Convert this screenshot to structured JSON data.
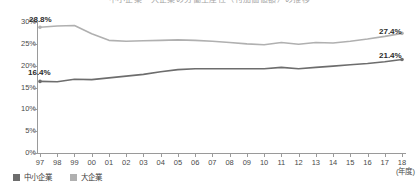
{
  "chart_data": {
    "type": "line",
    "title": "中小企業・大企業の労働生産性（付加価値額）の推移",
    "xlabel": "(年度)",
    "ylabel": "",
    "ylim": [
      0,
      30
    ],
    "ytick_labels": [
      "0%",
      "5%",
      "10%",
      "15%",
      "20%",
      "25%",
      "30%"
    ],
    "ytick_values": [
      0,
      5,
      10,
      15,
      20,
      25,
      30
    ],
    "grid": false,
    "legend_position": "bottom-left",
    "categories": [
      "97",
      "98",
      "99",
      "00",
      "01",
      "02",
      "03",
      "04",
      "05",
      "06",
      "07",
      "08",
      "09",
      "10",
      "11",
      "12",
      "13",
      "14",
      "15",
      "16",
      "17",
      "18"
    ],
    "series": [
      {
        "name": "中小企業",
        "color": "#6d6d6d",
        "values": [
          16.4,
          16.3,
          16.9,
          16.8,
          17.2,
          17.6,
          18.0,
          18.6,
          19.1,
          19.3,
          19.3,
          19.3,
          19.3,
          19.3,
          19.6,
          19.3,
          19.6,
          19.9,
          20.2,
          20.5,
          20.9,
          21.4
        ]
      },
      {
        "name": "大企業",
        "color": "#b0b0b0",
        "values": [
          28.8,
          29.1,
          29.2,
          27.3,
          25.8,
          25.6,
          25.7,
          25.8,
          25.9,
          25.8,
          25.6,
          25.3,
          25.0,
          24.8,
          25.3,
          24.9,
          25.3,
          25.2,
          25.6,
          26.1,
          26.7,
          27.4
        ]
      }
    ],
    "annotations": [
      {
        "id": "label-large-start",
        "text": "28.8%",
        "series": "大企業",
        "category": "97"
      },
      {
        "id": "label-sme-start",
        "text": "16.4%",
        "series": "中小企業",
        "category": "97"
      },
      {
        "id": "label-large-end",
        "text": "27.4%",
        "series": "大企業",
        "category": "18"
      },
      {
        "id": "label-sme-end",
        "text": "21.4%",
        "series": "中小企業",
        "category": "18"
      }
    ]
  },
  "axis": {
    "x_caption": "(年度)"
  },
  "legend": {
    "items": [
      {
        "label": "中小企業",
        "color": "#6d6d6d"
      },
      {
        "label": "大企業",
        "color": "#b0b0b0"
      }
    ]
  }
}
